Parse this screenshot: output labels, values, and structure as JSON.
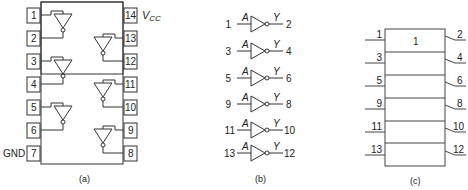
{
  "figure": {
    "panels": [
      {
        "id": "a",
        "caption": "(a)",
        "title": "Pin diagram (hex inverter)"
      },
      {
        "id": "b",
        "caption": "(b)",
        "title": "Logic symbols"
      },
      {
        "id": "c",
        "caption": "(c)",
        "title": "IEEE rectangular symbol"
      }
    ]
  },
  "panel_a": {
    "caption": "(a)",
    "left_pins": [
      "1",
      "2",
      "3",
      "4",
      "5",
      "6",
      "7"
    ],
    "right_pins": [
      "14",
      "13",
      "12",
      "11",
      "10",
      "9",
      "8"
    ],
    "vcc_label": "V",
    "vcc_sub": "CC",
    "gnd_label": "GND"
  },
  "panel_b": {
    "caption": "(b)",
    "input_label": "A",
    "output_label": "Y",
    "gates": [
      {
        "in": "1",
        "out": "2"
      },
      {
        "in": "3",
        "out": "4"
      },
      {
        "in": "5",
        "out": "6"
      },
      {
        "in": "9",
        "out": "8"
      },
      {
        "in": "11",
        "out": "10"
      },
      {
        "in": "13",
        "out": "12"
      }
    ]
  },
  "panel_c": {
    "caption": "(c)",
    "qualifier": "1",
    "rows": [
      {
        "in": "1",
        "out": "2"
      },
      {
        "in": "3",
        "out": "4"
      },
      {
        "in": "5",
        "out": "6"
      },
      {
        "in": "9",
        "out": "8"
      },
      {
        "in": "11",
        "out": "10"
      },
      {
        "in": "13",
        "out": "12"
      }
    ]
  }
}
